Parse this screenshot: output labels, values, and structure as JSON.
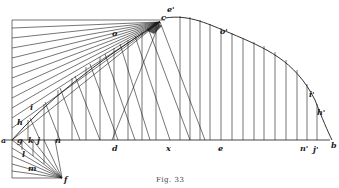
{
  "figure": {
    "caption": "Fig. 33",
    "colors": {
      "ink": "#1a1a1a",
      "paper": "#ffffff",
      "faint": "#555555"
    }
  },
  "labels": {
    "a": "a",
    "g": "g",
    "k": "k",
    "j": "j",
    "n": "n",
    "d": "d",
    "x": "x",
    "e": "e",
    "n_prime": "n'",
    "j_prime": "j'",
    "b": "b",
    "c": "c",
    "e_prime": "e'",
    "o": "o",
    "o_prime": "o'",
    "i": "i",
    "h": "h",
    "l": "l",
    "m": "m",
    "f": "f",
    "i_prime": "i'",
    "h_prime": "h'"
  }
}
